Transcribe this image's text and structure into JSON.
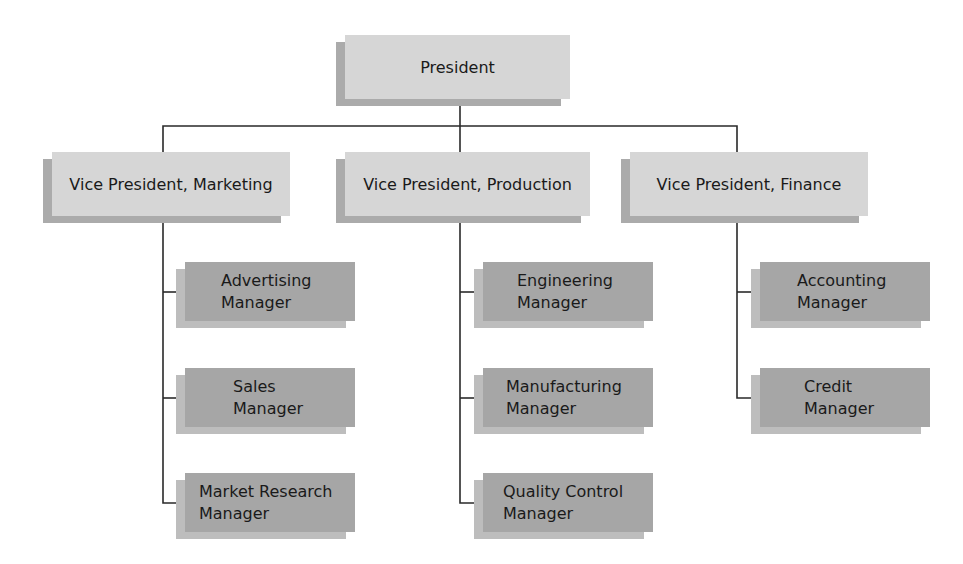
{
  "colors": {
    "top_box": "#d6d6d6",
    "manager_box": "#a6a6a6",
    "line": "#2a2a2a"
  },
  "president": {
    "label": "President"
  },
  "vice_presidents": [
    {
      "label": "Vice President, Marketing",
      "managers": [
        {
          "label": "Advertising\nManager"
        },
        {
          "label": "Sales\nManager"
        },
        {
          "label": "Market Research\nManager"
        }
      ]
    },
    {
      "label": "Vice President, Production",
      "managers": [
        {
          "label": "Engineering\nManager"
        },
        {
          "label": "Manufacturing\nManager"
        },
        {
          "label": "Quality Control\nManager"
        }
      ]
    },
    {
      "label": "Vice President, Finance",
      "managers": [
        {
          "label": "Accounting\nManager"
        },
        {
          "label": "Credit\nManager"
        }
      ]
    }
  ]
}
